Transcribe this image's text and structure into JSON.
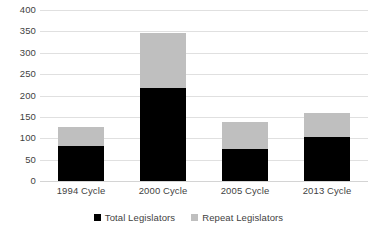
{
  "chart_data": {
    "type": "bar",
    "stacked": true,
    "title": "",
    "xlabel": "",
    "ylabel": "",
    "categories": [
      "1994 Cycle",
      "2000 Cycle",
      "2005 Cycle",
      "2013 Cycle"
    ],
    "series": [
      {
        "name": "Total Legislators",
        "color": "#000000",
        "values": [
          82,
          218,
          75,
          103
        ]
      },
      {
        "name": "Repeat Legislators",
        "color": "#bfbfbf",
        "values": [
          44,
          128,
          63,
          56
        ]
      }
    ],
    "stack_tops": [
      126,
      346,
      138,
      159
    ],
    "ylim": [
      0,
      400
    ],
    "ytick_values": [
      400,
      350,
      300,
      250,
      200,
      150,
      100,
      50,
      0
    ],
    "ytick_labels": [
      "400",
      "350",
      "300",
      "250",
      "200",
      "150",
      "100",
      "50",
      "0"
    ],
    "grid": true,
    "legend_position": "bottom"
  },
  "legend": {
    "entries": [
      {
        "label": "Total Legislators",
        "color": "#000000"
      },
      {
        "label": "Repeat Legislators",
        "color": "#bfbfbf"
      }
    ]
  },
  "colors": {
    "total": "#000000",
    "repeat": "#bfbfbf",
    "gridline": "#e0e0e0",
    "text": "#3f3f3f",
    "background": "#ffffff"
  }
}
